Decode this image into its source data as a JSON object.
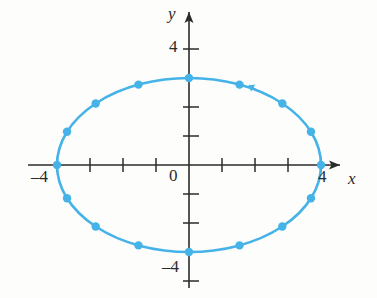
{
  "figure": {
    "name": "ellipse-parametric-curve-graph",
    "background_color": "#fdfdfc",
    "curve_color": "#45b3e7",
    "axis_color": "#2b2b2b"
  },
  "labels": {
    "x_axis": "x",
    "y_axis": "y",
    "origin": "0",
    "x_neg4": "–4",
    "x_pos4": "4",
    "y_pos4": "4",
    "y_neg4": "–4"
  },
  "chart_data": {
    "type": "scatter",
    "title": "",
    "subtitle": "",
    "xlabel": "x",
    "ylabel": "y",
    "xlim": [
      -4.8,
      4.8
    ],
    "ylim": [
      -4.8,
      4.8
    ],
    "xticks": [
      -4,
      -3,
      -2,
      -1,
      0,
      1,
      2,
      3,
      4
    ],
    "yticks": [
      -4,
      -3,
      -2,
      -1,
      0,
      1,
      2,
      3,
      4
    ],
    "xtick_labels": [
      "–4",
      "",
      "",
      "",
      "0",
      "",
      "",
      "",
      "4"
    ],
    "ytick_labels": [
      "–4",
      "",
      "",
      "",
      "",
      "",
      "",
      "",
      "4"
    ],
    "grid": false,
    "legend": null,
    "curve": {
      "name": "ellipse",
      "equation": "x^2/16 + y^2/9 = 1",
      "parametric": "x = 4 cos t, y = 3 sin t",
      "semi_axis_x": 4,
      "semi_axis_y": 3,
      "color": "#45b3e7",
      "line_width": 2.6
    },
    "marker_color": "#45b3e7",
    "marker_radius": 4.2,
    "point_count": 16,
    "points": [
      {
        "t_deg": 0,
        "x": 4.0,
        "y": 0.0
      },
      {
        "t_deg": 22.5,
        "x": 3.696,
        "y": 1.148
      },
      {
        "t_deg": 45,
        "x": 2.828,
        "y": 2.121
      },
      {
        "t_deg": 67.5,
        "x": 1.531,
        "y": 2.772
      },
      {
        "t_deg": 90,
        "x": 0.0,
        "y": 3.0
      },
      {
        "t_deg": 112.5,
        "x": -1.531,
        "y": 2.772
      },
      {
        "t_deg": 135,
        "x": -2.828,
        "y": 2.121
      },
      {
        "t_deg": 157.5,
        "x": -3.696,
        "y": 1.148
      },
      {
        "t_deg": 180,
        "x": -4.0,
        "y": 0.0
      },
      {
        "t_deg": 202.5,
        "x": -3.696,
        "y": -1.148
      },
      {
        "t_deg": 225,
        "x": -2.828,
        "y": -2.121
      },
      {
        "t_deg": 247.5,
        "x": -1.531,
        "y": -2.772
      },
      {
        "t_deg": 270,
        "x": 0.0,
        "y": -3.0
      },
      {
        "t_deg": 292.5,
        "x": 1.531,
        "y": -2.772
      },
      {
        "t_deg": 315,
        "x": 2.828,
        "y": -2.121
      },
      {
        "t_deg": 337.5,
        "x": 3.696,
        "y": -1.148
      }
    ],
    "annotations": [
      {
        "name": "direction-arrow",
        "type": "arrowhead",
        "at": {
          "x": 2.1,
          "y": 2.55
        },
        "direction_deg": 150,
        "meaning": "counterclockwise"
      }
    ]
  }
}
